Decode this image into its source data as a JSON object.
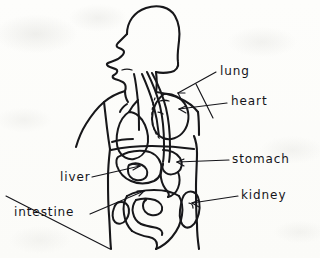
{
  "drawing": {
    "title": "Hand-drawn human torso anatomy sketch",
    "medium": "ink on paper",
    "orientation": "left-facing profile",
    "paper_color": "#fdfdfb",
    "ink_color": "#17171a"
  },
  "labels": [
    {
      "id": "lung",
      "text": "lung",
      "x": 220,
      "y": 75,
      "side": "right",
      "target_x": 171,
      "target_y": 95
    },
    {
      "id": "heart",
      "text": "heart",
      "x": 231,
      "y": 105,
      "side": "right",
      "target_x": 177,
      "target_y": 111
    },
    {
      "id": "stomach",
      "text": "stomach",
      "x": 232,
      "y": 163,
      "side": "right",
      "target_x": 176,
      "target_y": 162
    },
    {
      "id": "kidney",
      "text": "kidney",
      "x": 241,
      "y": 199,
      "side": "right",
      "target_x": 192,
      "target_y": 202
    },
    {
      "id": "liver",
      "text": "liver",
      "x": 60,
      "y": 181,
      "side": "left",
      "target_x": 137,
      "target_y": 166
    },
    {
      "id": "intestine",
      "text": "intestine",
      "x": 14,
      "y": 216,
      "side": "left",
      "target_x": 140,
      "target_y": 196
    }
  ],
  "organs": [
    {
      "id": "lung",
      "name": "lung"
    },
    {
      "id": "heart",
      "name": "heart"
    },
    {
      "id": "stomach",
      "name": "stomach"
    },
    {
      "id": "kidney",
      "name": "kidney"
    },
    {
      "id": "liver",
      "name": "liver"
    },
    {
      "id": "intestine",
      "name": "intestine"
    },
    {
      "id": "trachea",
      "name": "trachea"
    },
    {
      "id": "esophagus",
      "name": "esophagus"
    }
  ]
}
